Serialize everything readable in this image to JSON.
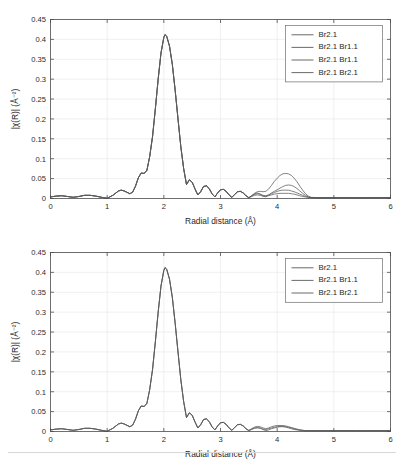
{
  "figure": {
    "panels": [
      {
        "id": "top",
        "axis": {
          "xlabel": "Radial distance (Å)",
          "ylabel": "|χ(R)| (Å⁻²)",
          "xticks": [
            "0",
            "1",
            "2",
            "3",
            "4",
            "5",
            "6"
          ],
          "xtick_values": [
            0,
            1,
            2,
            3,
            4,
            5,
            6
          ],
          "yticks": [
            "0",
            "0.05",
            "0.1",
            "0.15",
            "0.2",
            "0.25",
            "0.3",
            "0.35",
            "0.4",
            "0.45"
          ],
          "ytick_values": [
            0,
            0.05,
            0.1,
            0.15,
            0.2,
            0.25,
            0.3,
            0.35,
            0.4,
            0.45
          ],
          "xlim": [
            0,
            6
          ],
          "ylim": [
            0,
            0.45
          ]
        },
        "legend": {
          "position": "top-right",
          "entries": [
            {
              "label": "Br2.1",
              "color": "#5a5a5a"
            },
            {
              "label": "Br2.1 Br1.1",
              "color": "#5a5a5a"
            },
            {
              "label": "Br2.1 Br1.1",
              "color": "#5a5a5a"
            },
            {
              "label": "Br2.1 Br2.1",
              "color": "#5a5a5a"
            }
          ]
        }
      },
      {
        "id": "bottom",
        "axis": {
          "xlabel": "Radial distance (Å)",
          "ylabel": "|χ(R)| (Å⁻²)",
          "xticks": [
            "0",
            "1",
            "2",
            "3",
            "4",
            "5",
            "6"
          ],
          "xtick_values": [
            0,
            1,
            2,
            3,
            4,
            5,
            6
          ],
          "yticks": [
            "0",
            "0.05",
            "0.1",
            "0.15",
            "0.2",
            "0.25",
            "0.3",
            "0.35",
            "0.4",
            "0.45"
          ],
          "ytick_values": [
            0,
            0.05,
            0.1,
            0.15,
            0.2,
            0.25,
            0.3,
            0.35,
            0.4,
            0.45
          ],
          "xlim": [
            0,
            6
          ],
          "ylim": [
            0,
            0.45
          ]
        },
        "legend": {
          "position": "top-right",
          "entries": [
            {
              "label": "Br2.1",
              "color": "#5a5a5a"
            },
            {
              "label": "Br2.1 Br1.1",
              "color": "#5a5a5a"
            },
            {
              "label": "Br2.1 Br2.1",
              "color": "#5a5a5a"
            }
          ]
        }
      }
    ]
  },
  "chart_data": [
    {
      "type": "line",
      "title": "",
      "xlabel": "Radial distance (Å)",
      "ylabel": "|χ(R)| (Å⁻²)",
      "xlim": [
        0,
        6
      ],
      "ylim": [
        0,
        0.45
      ],
      "grid": true,
      "legend_position": "top-right",
      "x": [
        0,
        0.1,
        0.2,
        0.3,
        0.4,
        0.5,
        0.6,
        0.7,
        0.8,
        0.9,
        1.0,
        1.1,
        1.2,
        1.25,
        1.3,
        1.4,
        1.45,
        1.5,
        1.55,
        1.6,
        1.65,
        1.7,
        1.75,
        1.8,
        1.85,
        1.9,
        1.95,
        2.0,
        2.02,
        2.05,
        2.1,
        2.15,
        2.2,
        2.25,
        2.3,
        2.35,
        2.4,
        2.45,
        2.5,
        2.55,
        2.6,
        2.65,
        2.7,
        2.75,
        2.8,
        2.85,
        2.9,
        2.95,
        3.0,
        3.05,
        3.1,
        3.15,
        3.2,
        3.25,
        3.3,
        3.35,
        3.4,
        3.45,
        3.5,
        3.55,
        3.6,
        3.65,
        3.7,
        3.75,
        3.8,
        3.85,
        3.9,
        3.95,
        4.0,
        4.05,
        4.1,
        4.15,
        4.2,
        4.25,
        4.3,
        4.35,
        4.4,
        4.45,
        4.5,
        4.55,
        4.6,
        4.7,
        4.8,
        4.9,
        5.0,
        5.2,
        5.4,
        5.6,
        5.8,
        6.0
      ],
      "series": [
        {
          "name": "Br2.1",
          "values": [
            0.004,
            0.006,
            0.007,
            0.005,
            0.003,
            0.005,
            0.008,
            0.008,
            0.006,
            0.003,
            0.0005,
            0.008,
            0.019,
            0.021,
            0.019,
            0.012,
            0.016,
            0.031,
            0.052,
            0.064,
            0.063,
            0.07,
            0.105,
            0.155,
            0.225,
            0.3,
            0.366,
            0.405,
            0.412,
            0.408,
            0.383,
            0.337,
            0.272,
            0.2,
            0.13,
            0.075,
            0.035,
            0.047,
            0.041,
            0.024,
            0.009,
            0.017,
            0.03,
            0.032,
            0.025,
            0.012,
            0.004,
            0.014,
            0.022,
            0.023,
            0.018,
            0.009,
            0.003,
            0.01,
            0.017,
            0.018,
            0.014,
            0.007,
            0.002,
            0.007,
            0.012,
            0.014,
            0.011,
            0.006,
            0.004,
            0.009,
            0.014,
            0.018,
            0.022,
            0.026,
            0.03,
            0.033,
            0.034,
            0.033,
            0.03,
            0.025,
            0.019,
            0.013,
            0.008,
            0.004,
            0.002,
            0.002,
            0.002,
            0.002,
            0.002,
            0.002,
            0.002,
            0.002,
            0.002,
            0.002
          ]
        },
        {
          "name": "Br2.1 Br1.1",
          "values": [
            0.004,
            0.006,
            0.007,
            0.005,
            0.003,
            0.005,
            0.008,
            0.008,
            0.006,
            0.003,
            0.0005,
            0.008,
            0.019,
            0.021,
            0.019,
            0.012,
            0.016,
            0.031,
            0.052,
            0.064,
            0.063,
            0.07,
            0.105,
            0.155,
            0.225,
            0.3,
            0.366,
            0.405,
            0.412,
            0.408,
            0.383,
            0.337,
            0.272,
            0.2,
            0.13,
            0.075,
            0.035,
            0.047,
            0.041,
            0.024,
            0.009,
            0.017,
            0.03,
            0.032,
            0.025,
            0.012,
            0.004,
            0.014,
            0.022,
            0.023,
            0.018,
            0.009,
            0.003,
            0.01,
            0.017,
            0.018,
            0.014,
            0.007,
            0.002,
            0.007,
            0.013,
            0.017,
            0.018,
            0.017,
            0.018,
            0.024,
            0.033,
            0.043,
            0.051,
            0.058,
            0.062,
            0.063,
            0.062,
            0.058,
            0.051,
            0.042,
            0.031,
            0.021,
            0.012,
            0.006,
            0.003,
            0.002,
            0.002,
            0.002,
            0.002,
            0.002,
            0.002,
            0.002,
            0.002,
            0.002
          ]
        },
        {
          "name": "Br2.1 Br1.1 (2)",
          "values": [
            0.004,
            0.006,
            0.007,
            0.005,
            0.003,
            0.005,
            0.008,
            0.008,
            0.006,
            0.003,
            0.0005,
            0.008,
            0.019,
            0.021,
            0.019,
            0.012,
            0.016,
            0.031,
            0.052,
            0.064,
            0.063,
            0.07,
            0.105,
            0.155,
            0.225,
            0.3,
            0.366,
            0.405,
            0.412,
            0.408,
            0.383,
            0.337,
            0.272,
            0.2,
            0.13,
            0.075,
            0.035,
            0.047,
            0.041,
            0.024,
            0.009,
            0.017,
            0.03,
            0.032,
            0.025,
            0.012,
            0.004,
            0.014,
            0.022,
            0.023,
            0.018,
            0.009,
            0.003,
            0.01,
            0.017,
            0.018,
            0.014,
            0.007,
            0.002,
            0.006,
            0.01,
            0.012,
            0.011,
            0.008,
            0.007,
            0.009,
            0.012,
            0.015,
            0.018,
            0.02,
            0.021,
            0.021,
            0.021,
            0.019,
            0.017,
            0.014,
            0.011,
            0.008,
            0.005,
            0.003,
            0.002,
            0.002,
            0.002,
            0.002,
            0.002,
            0.002,
            0.002,
            0.002,
            0.002,
            0.002
          ]
        },
        {
          "name": "Br2.1 Br2.1",
          "values": [
            0.004,
            0.006,
            0.007,
            0.005,
            0.003,
            0.005,
            0.008,
            0.008,
            0.006,
            0.003,
            0.0005,
            0.008,
            0.019,
            0.021,
            0.019,
            0.012,
            0.016,
            0.031,
            0.052,
            0.064,
            0.063,
            0.07,
            0.105,
            0.155,
            0.225,
            0.3,
            0.366,
            0.405,
            0.412,
            0.408,
            0.383,
            0.337,
            0.272,
            0.2,
            0.13,
            0.075,
            0.035,
            0.047,
            0.041,
            0.024,
            0.009,
            0.017,
            0.03,
            0.032,
            0.025,
            0.012,
            0.004,
            0.014,
            0.022,
            0.023,
            0.018,
            0.009,
            0.003,
            0.01,
            0.017,
            0.018,
            0.014,
            0.007,
            0.002,
            0.005,
            0.008,
            0.009,
            0.008,
            0.006,
            0.006,
            0.007,
            0.009,
            0.011,
            0.012,
            0.013,
            0.013,
            0.013,
            0.013,
            0.012,
            0.011,
            0.009,
            0.007,
            0.005,
            0.004,
            0.003,
            0.002,
            0.002,
            0.002,
            0.002,
            0.002,
            0.002,
            0.002,
            0.002,
            0.002,
            0.002
          ]
        }
      ]
    },
    {
      "type": "line",
      "title": "",
      "xlabel": "Radial distance (Å)",
      "ylabel": "|χ(R)| (Å⁻²)",
      "xlim": [
        0,
        6
      ],
      "ylim": [
        0,
        0.45
      ],
      "grid": true,
      "legend_position": "top-right",
      "x": [
        0,
        0.1,
        0.2,
        0.3,
        0.4,
        0.5,
        0.6,
        0.7,
        0.8,
        0.9,
        1.0,
        1.1,
        1.2,
        1.25,
        1.3,
        1.4,
        1.45,
        1.5,
        1.55,
        1.6,
        1.65,
        1.7,
        1.75,
        1.8,
        1.85,
        1.9,
        1.95,
        2.0,
        2.02,
        2.05,
        2.1,
        2.15,
        2.2,
        2.25,
        2.3,
        2.35,
        2.4,
        2.45,
        2.5,
        2.55,
        2.6,
        2.65,
        2.7,
        2.75,
        2.8,
        2.85,
        2.9,
        2.95,
        3.0,
        3.05,
        3.1,
        3.15,
        3.2,
        3.25,
        3.3,
        3.35,
        3.4,
        3.45,
        3.5,
        3.55,
        3.6,
        3.65,
        3.7,
        3.75,
        3.8,
        3.85,
        3.9,
        3.95,
        4.0,
        4.05,
        4.1,
        4.15,
        4.2,
        4.25,
        4.3,
        4.35,
        4.4,
        4.45,
        4.5,
        4.55,
        4.6,
        4.7,
        4.8,
        4.9,
        5.0,
        5.2,
        5.4,
        5.6,
        5.8,
        6.0
      ],
      "series": [
        {
          "name": "Br2.1",
          "values": [
            0.004,
            0.006,
            0.007,
            0.005,
            0.003,
            0.005,
            0.008,
            0.008,
            0.006,
            0.003,
            0.0005,
            0.008,
            0.019,
            0.021,
            0.019,
            0.012,
            0.016,
            0.031,
            0.052,
            0.064,
            0.063,
            0.07,
            0.105,
            0.155,
            0.225,
            0.3,
            0.366,
            0.405,
            0.412,
            0.408,
            0.383,
            0.337,
            0.272,
            0.2,
            0.13,
            0.075,
            0.035,
            0.047,
            0.041,
            0.024,
            0.009,
            0.017,
            0.03,
            0.032,
            0.025,
            0.012,
            0.004,
            0.014,
            0.022,
            0.023,
            0.018,
            0.009,
            0.003,
            0.01,
            0.017,
            0.018,
            0.014,
            0.007,
            0.002,
            0.006,
            0.009,
            0.01,
            0.009,
            0.005,
            0.002,
            0.004,
            0.007,
            0.009,
            0.011,
            0.012,
            0.012,
            0.011,
            0.009,
            0.007,
            0.005,
            0.004,
            0.003,
            0.002,
            0.002,
            0.002,
            0.002,
            0.002,
            0.002,
            0.002,
            0.002,
            0.002,
            0.002,
            0.002,
            0.002,
            0.002
          ]
        },
        {
          "name": "Br2.1 Br1.1",
          "values": [
            0.004,
            0.006,
            0.007,
            0.005,
            0.003,
            0.005,
            0.008,
            0.008,
            0.006,
            0.003,
            0.0005,
            0.008,
            0.019,
            0.021,
            0.019,
            0.012,
            0.016,
            0.031,
            0.052,
            0.064,
            0.063,
            0.07,
            0.105,
            0.155,
            0.225,
            0.3,
            0.366,
            0.405,
            0.412,
            0.408,
            0.383,
            0.337,
            0.272,
            0.2,
            0.13,
            0.075,
            0.035,
            0.047,
            0.041,
            0.024,
            0.009,
            0.017,
            0.03,
            0.032,
            0.025,
            0.012,
            0.004,
            0.014,
            0.022,
            0.023,
            0.018,
            0.009,
            0.003,
            0.01,
            0.017,
            0.018,
            0.014,
            0.007,
            0.003,
            0.007,
            0.011,
            0.013,
            0.012,
            0.009,
            0.007,
            0.009,
            0.012,
            0.014,
            0.015,
            0.015,
            0.015,
            0.014,
            0.012,
            0.01,
            0.008,
            0.006,
            0.004,
            0.003,
            0.002,
            0.002,
            0.002,
            0.002,
            0.002,
            0.002,
            0.002,
            0.002,
            0.002,
            0.002,
            0.002,
            0.002
          ]
        },
        {
          "name": "Br2.1 Br2.1",
          "values": [
            0.004,
            0.006,
            0.007,
            0.005,
            0.003,
            0.005,
            0.008,
            0.008,
            0.006,
            0.003,
            0.0005,
            0.008,
            0.019,
            0.021,
            0.019,
            0.012,
            0.016,
            0.031,
            0.052,
            0.064,
            0.063,
            0.07,
            0.105,
            0.155,
            0.225,
            0.3,
            0.366,
            0.405,
            0.412,
            0.408,
            0.383,
            0.337,
            0.272,
            0.2,
            0.13,
            0.075,
            0.035,
            0.047,
            0.041,
            0.024,
            0.009,
            0.017,
            0.03,
            0.032,
            0.025,
            0.012,
            0.004,
            0.014,
            0.022,
            0.023,
            0.018,
            0.009,
            0.003,
            0.01,
            0.017,
            0.018,
            0.014,
            0.007,
            0.002,
            0.005,
            0.008,
            0.009,
            0.008,
            0.006,
            0.005,
            0.007,
            0.009,
            0.011,
            0.012,
            0.013,
            0.013,
            0.012,
            0.011,
            0.009,
            0.007,
            0.005,
            0.004,
            0.003,
            0.002,
            0.002,
            0.002,
            0.002,
            0.002,
            0.002,
            0.002,
            0.002,
            0.002,
            0.002,
            0.002,
            0.002
          ]
        }
      ]
    }
  ]
}
